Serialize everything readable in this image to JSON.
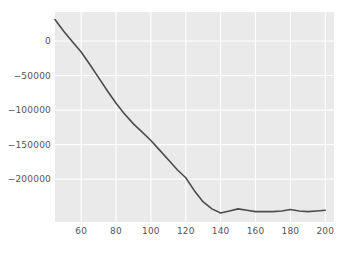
{
  "chart_data": {
    "type": "line",
    "title": "",
    "xlabel": "",
    "ylabel": "",
    "xlim": [
      45,
      205
    ],
    "ylim": [
      -262000,
      42000
    ],
    "xticks": [
      60,
      80,
      100,
      120,
      140,
      160,
      180,
      200
    ],
    "xtick_labels": [
      "60",
      "80",
      "100",
      "120",
      "140",
      "160",
      "180",
      "200"
    ],
    "yticks": [
      0,
      -50000,
      -100000,
      -150000,
      -200000
    ],
    "ytick_labels": [
      "0",
      "−50000",
      "−100000",
      "−150000",
      "−200000"
    ],
    "grid": true,
    "grid_color": "#ffffff",
    "plot_background": "#eaeaea",
    "figure_background": "#ffffff",
    "legend": null,
    "series": [
      {
        "name": "curve",
        "color": "#4c4c4c",
        "linewidth": 1.6,
        "x": [
          45,
          50,
          55,
          60,
          65,
          70,
          75,
          80,
          85,
          90,
          95,
          100,
          105,
          110,
          115,
          120,
          125,
          130,
          135,
          140,
          145,
          150,
          155,
          160,
          165,
          170,
          175,
          180,
          185,
          190,
          195,
          200
        ],
        "y": [
          31000,
          14000,
          -1000,
          -16000,
          -34000,
          -53000,
          -72000,
          -90000,
          -106000,
          -120000,
          -132000,
          -144000,
          -158000,
          -172000,
          -186000,
          -198000,
          -217000,
          -233000,
          -243000,
          -249000,
          -246000,
          -243000,
          -245000,
          -247000,
          -247000,
          -247000,
          -246000,
          -244000,
          -246000,
          -247000,
          -246000,
          -245000
        ]
      }
    ]
  }
}
